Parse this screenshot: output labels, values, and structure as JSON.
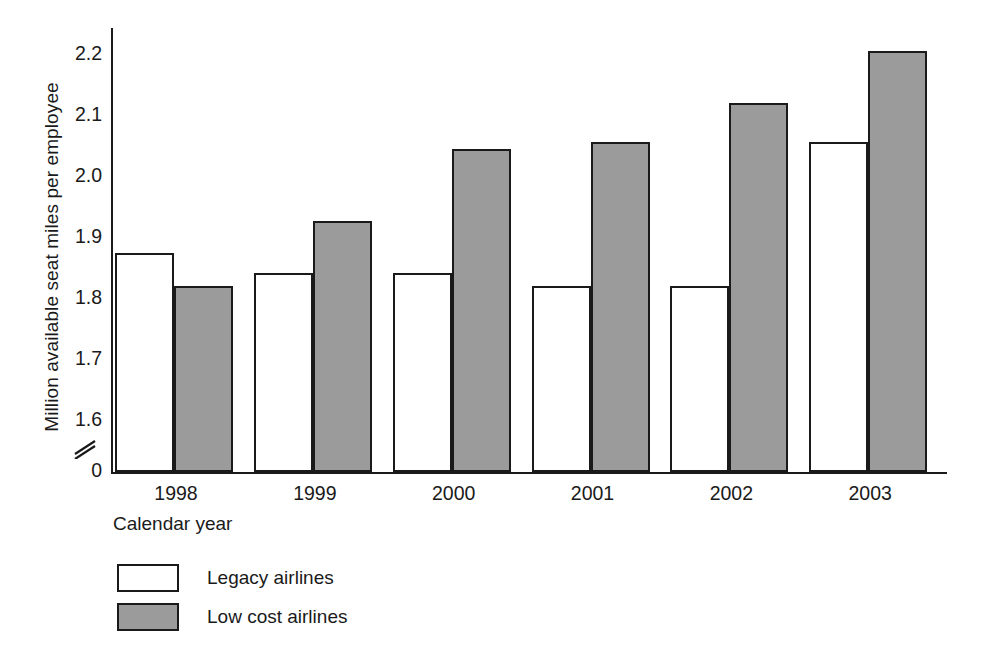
{
  "chart_data": {
    "type": "bar",
    "title": "",
    "subtitle": "",
    "xlabel": "Calendar year",
    "ylabel": "Million available seat miles per employee",
    "categories": [
      "1998",
      "1999",
      "2000",
      "2001",
      "2002",
      "2003"
    ],
    "series": [
      {
        "name": "Legacy airlines",
        "values": [
          1.89,
          1.86,
          1.86,
          1.84,
          1.84,
          2.06
        ],
        "color": "#ffffff"
      },
      {
        "name": "Low cost airlines",
        "values": [
          1.84,
          1.94,
          2.05,
          2.06,
          2.12,
          2.2
        ],
        "color": "#9b9b9b"
      }
    ],
    "yticks": [
      "0",
      "1.6",
      "1.7",
      "1.8",
      "1.9",
      "2.0",
      "2.1",
      "2.2"
    ],
    "ytick_values": [
      0,
      1.6,
      1.7,
      1.8,
      1.9,
      2.0,
      2.1,
      2.2
    ],
    "ylim": [
      1.555,
      2.235
    ],
    "axis_break": true,
    "axis_break_glyph": "//",
    "grid": false,
    "legend_position": "bottom-left",
    "legend": [
      {
        "label": "Legacy airlines",
        "swatch": "white-outlined"
      },
      {
        "label": "Low cost airlines",
        "swatch": "gray-filled"
      }
    ]
  },
  "axis": {
    "y_title": "Million available seat miles per employee",
    "x_title": "Calendar year",
    "y_labels": [
      "2.2",
      "2.1",
      "2.0",
      "1.9",
      "1.8",
      "1.7",
      "1.6",
      "0"
    ],
    "x_labels": [
      "1998",
      "1999",
      "2000",
      "2001",
      "2002",
      "2003"
    ]
  },
  "legend": {
    "rows": [
      {
        "label": "Legacy airlines"
      },
      {
        "label": "Low cost airlines"
      }
    ]
  },
  "colors": {
    "ink": "#1a1a1a",
    "legacy_fill": "#ffffff",
    "lowcost_fill": "#9b9b9b",
    "background": "#ffffff"
  }
}
